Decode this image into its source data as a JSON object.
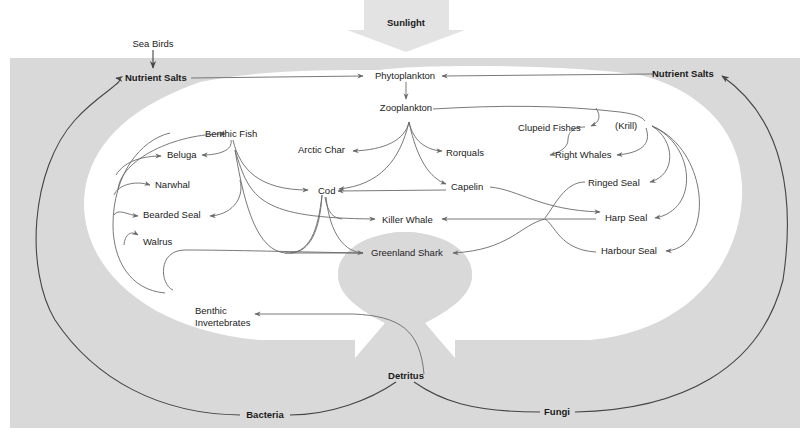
{
  "colors": {
    "background": "#ffffff",
    "band": "#d9d9d9",
    "sunlight_arrow": "#e3e3e3",
    "edge": "#6a6a6a",
    "cycle_edge": "#444444",
    "text": "#222222"
  },
  "nodes": {
    "sunlight": "Sunlight",
    "sea_birds": "Sea Birds",
    "nutrient_salts_left": "Nutrient Salts",
    "nutrient_salts_right": "Nutrient Salts",
    "phytoplankton": "Phytoplankton",
    "zooplankton": "Zooplankton",
    "krill": "(Krill)",
    "clupeid_fishes": "Clupeid Fishes",
    "right_whales": "Right Whales",
    "rorquals": "Rorquals",
    "arctic_char": "Arctic Char",
    "benthic_fish": "Benthic Fish",
    "beluga": "Beluga",
    "narwhal": "Narwhal",
    "bearded_seal": "Bearded Seal",
    "walrus": "Walrus",
    "cod": "Cod",
    "capelin": "Capelin",
    "killer_whale": "Killer Whale",
    "greenland_shark": "Greenland Shark",
    "ringed_seal": "Ringed Seal",
    "harp_seal": "Harp Seal",
    "harbour_seal": "Harbour Seal",
    "benthic_invertebrates_1": "Benthic",
    "benthic_invertebrates_2": "Invertebrates",
    "detritus": "Detritus",
    "bacteria": "Bacteria",
    "fungi": "Fungi"
  },
  "edges": [
    {
      "from": "Sunlight",
      "to": "Phytoplankton"
    },
    {
      "from": "Sea Birds",
      "to": "Nutrient Salts (left)"
    },
    {
      "from": "Nutrient Salts (left)",
      "to": "Phytoplankton"
    },
    {
      "from": "Nutrient Salts (right)",
      "to": "Phytoplankton"
    },
    {
      "from": "Phytoplankton",
      "to": "Zooplankton"
    },
    {
      "from": "Zooplankton",
      "to": "Arctic Char"
    },
    {
      "from": "Zooplankton",
      "to": "Rorquals"
    },
    {
      "from": "Zooplankton",
      "to": "Cod"
    },
    {
      "from": "Zooplankton",
      "to": "Capelin"
    },
    {
      "from": "Zooplankton",
      "to": "Clupeid Fishes"
    },
    {
      "from": "Clupeid Fishes",
      "to": "Rorquals"
    },
    {
      "from": "(Krill)",
      "to": "Right Whales"
    },
    {
      "from": "(Krill)",
      "to": "Ringed Seal"
    },
    {
      "from": "(Krill)",
      "to": "Harp Seal"
    },
    {
      "from": "(Krill)",
      "to": "Harbour Seal"
    },
    {
      "from": "Capelin",
      "to": "Cod"
    },
    {
      "from": "Capelin",
      "to": "Harp Seal"
    },
    {
      "from": "Benthic Fish",
      "to": "Beluga"
    },
    {
      "from": "Benthic Fish",
      "to": "Cod"
    },
    {
      "from": "Benthic Fish",
      "to": "Bearded Seal"
    },
    {
      "from": "Benthic Fish",
      "to": "Killer Whale"
    },
    {
      "from": "Benthic Fish",
      "to": "Greenland Shark"
    },
    {
      "from": "Cod",
      "to": "Killer Whale"
    },
    {
      "from": "Cod",
      "to": "Greenland Shark"
    },
    {
      "from": "Seals",
      "to": "Killer Whale"
    },
    {
      "from": "Seals",
      "to": "Greenland Shark"
    },
    {
      "from": "Benthic Invertebrates",
      "to": "Benthic Fish"
    },
    {
      "from": "Benthic Invertebrates",
      "to": "Beluga"
    },
    {
      "from": "Benthic Invertebrates",
      "to": "Narwhal"
    },
    {
      "from": "Benthic Invertebrates",
      "to": "Bearded Seal"
    },
    {
      "from": "Benthic Invertebrates",
      "to": "Walrus"
    },
    {
      "from": "Benthic Invertebrates",
      "to": "Greenland Shark"
    },
    {
      "from": "Detritus",
      "to": "Benthic Invertebrates"
    },
    {
      "from": "Detritus",
      "to": "Bacteria"
    },
    {
      "from": "Detritus",
      "to": "Fungi"
    },
    {
      "from": "Bacteria",
      "to": "Nutrient Salts (left)"
    },
    {
      "from": "Fungi",
      "to": "Nutrient Salts (right)"
    }
  ]
}
